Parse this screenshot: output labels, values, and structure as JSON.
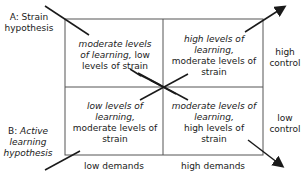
{
  "hypotheses": {
    "a": {
      "prefix": "A: Strain",
      "line2": "hypothesis"
    },
    "b": {
      "prefix": "B:",
      "italic1": "Active",
      "italic2": "learning",
      "italic3": "hypothesis"
    }
  },
  "quadrants": {
    "top_left": {
      "italic": "moderate levels of learning,",
      "italic_l1": "moderate levels",
      "italic_l2": "of learning,",
      "normal_tail": " low",
      "normal_l3": "levels of strain"
    },
    "top_right": {
      "italic_l1": "high levels of",
      "italic_l2": "learning,",
      "normal_l3": "moderate levels of",
      "normal_l4": "strain"
    },
    "bottom_left": {
      "italic_l1": "low levels of",
      "italic_l2": "learning,",
      "normal_l3": "moderate levels of",
      "normal_l4": "strain"
    },
    "bottom_right": {
      "italic_l1": "moderate levels of",
      "italic_l2": "learning,",
      "normal_l3": "high levels of",
      "normal_l4": "strain"
    }
  },
  "axes": {
    "x": {
      "low": "low demands",
      "high": "high demands"
    },
    "y": {
      "high_l1": "high",
      "high_l2": "control",
      "low_l1": "low",
      "low_l2": "control"
    }
  },
  "colors": {
    "line": "#1a1a1a",
    "box": "#555555",
    "background": "#ffffff"
  }
}
